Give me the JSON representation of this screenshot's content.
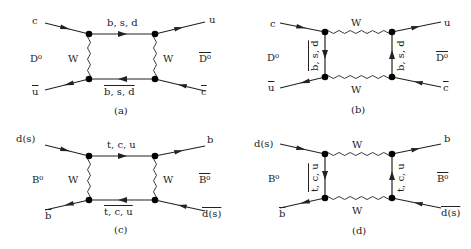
{
  "figure": {
    "diagrams": [
      {
        "id": "a",
        "caption": "(a)",
        "incoming_top": "c",
        "outgoing_top": "u",
        "incoming_bottom": "u",
        "incoming_bottom_bar": true,
        "outgoing_bottom": "c",
        "outgoing_bottom_bar": true,
        "initial_meson": "D⁰",
        "final_meson": "D⁰",
        "final_meson_bar": true,
        "top_internal": "b, s, d",
        "bottom_internal": "b, s, d",
        "bottom_internal_bar": true,
        "left_internal": "W",
        "right_internal": "W",
        "boson_orientation": "vertical"
      },
      {
        "id": "b",
        "caption": "(b)",
        "incoming_top": "c",
        "outgoing_top": "u",
        "incoming_bottom": "u",
        "incoming_bottom_bar": true,
        "outgoing_bottom": "c",
        "outgoing_bottom_bar": true,
        "initial_meson": "D⁰",
        "final_meson": "D⁰",
        "final_meson_bar": true,
        "top_internal": "W",
        "bottom_internal": "W",
        "left_internal": "b, s, d",
        "left_internal_bar": true,
        "right_internal": "b, s, d",
        "boson_orientation": "horizontal"
      },
      {
        "id": "c",
        "caption": "(c)",
        "incoming_top": "d(s)",
        "outgoing_top": "b",
        "incoming_bottom": "b",
        "incoming_bottom_bar": true,
        "outgoing_bottom": "d(s)",
        "outgoing_bottom_bar": true,
        "initial_meson": "B⁰",
        "final_meson": "B⁰",
        "final_meson_bar": true,
        "top_internal": "t, c, u",
        "bottom_internal": "t, c, u",
        "bottom_internal_bar": true,
        "left_internal": "W",
        "right_internal": "W",
        "boson_orientation": "vertical"
      },
      {
        "id": "d",
        "caption": "(d)",
        "incoming_top": "d(s)",
        "outgoing_top": "b",
        "incoming_bottom": "b",
        "incoming_bottom_bar": true,
        "outgoing_bottom": "d(s)",
        "outgoing_bottom_bar": true,
        "initial_meson": "B⁰",
        "final_meson": "B⁰",
        "final_meson_bar": true,
        "top_internal": "W",
        "bottom_internal": "W",
        "left_internal": "t, c, u",
        "left_internal_bar": true,
        "right_internal": "t, c, u",
        "boson_orientation": "horizontal"
      }
    ]
  }
}
